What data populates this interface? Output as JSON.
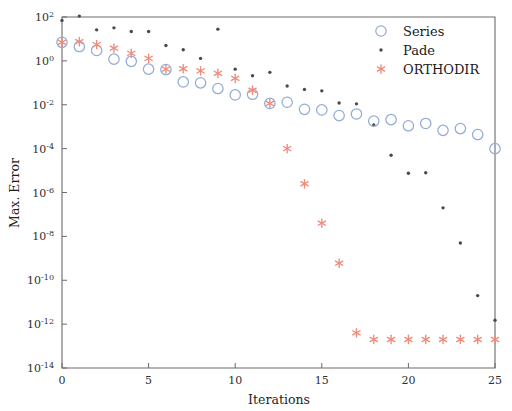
{
  "chart_data": {
    "type": "scatter",
    "title": "",
    "xlabel": "Iterations",
    "ylabel": "Max. Error",
    "xlim": [
      0,
      25
    ],
    "ylim": [
      1e-14,
      100.0
    ],
    "yscale": "log",
    "xscale": "linear",
    "grid": false,
    "legend_position": "top-right",
    "xticks": [
      0,
      5,
      10,
      15,
      20,
      25
    ],
    "xticklabels": [
      "0",
      "5",
      "10",
      "15",
      "20",
      "25"
    ],
    "yticks": [
      100,
      1,
      0.01,
      0.0001,
      1e-06,
      1e-08,
      1e-10,
      1e-12,
      1e-14
    ],
    "yticklabels": [
      "10^2",
      "10^0",
      "10^-2",
      "10^-4",
      "10^-6",
      "10^-8",
      "10^-10",
      "10^-12",
      "10^-14"
    ],
    "ytick_exponents": [
      "2",
      "0",
      "-2",
      "-4",
      "-6",
      "-8",
      "-10",
      "-12",
      "-14"
    ],
    "x": [
      0,
      1,
      2,
      3,
      4,
      5,
      6,
      7,
      8,
      9,
      10,
      11,
      12,
      13,
      14,
      15,
      16,
      17,
      18,
      19,
      20,
      21,
      22,
      23,
      24,
      25
    ],
    "series": [
      {
        "name": "Series",
        "marker": "circle-open",
        "color": "#93acd3",
        "values": [
          7.0,
          4.5,
          3.0,
          1.2,
          0.95,
          0.42,
          0.4,
          0.11,
          0.1,
          0.055,
          0.028,
          0.03,
          0.0115,
          0.013,
          0.0062,
          0.0058,
          0.0032,
          0.0038,
          0.0018,
          0.0021,
          0.0011,
          0.0014,
          0.00068,
          0.00082,
          0.00044,
          0.0001
        ]
      },
      {
        "name": "Pade",
        "marker": "dot",
        "color": "#4a4a4a",
        "values": [
          70.0,
          110.0,
          26.0,
          32.0,
          22.0,
          22.0,
          5.0,
          3.2,
          1.3,
          28.0,
          0.42,
          0.21,
          0.3,
          0.072,
          0.05,
          0.043,
          0.012,
          0.011,
          0.0012,
          5e-05,
          7.5e-06,
          8e-06,
          2e-07,
          5e-09,
          2e-11,
          1.5e-12
        ]
      },
      {
        "name": "ORTHODIR",
        "marker": "asterisk",
        "color": "#f08a7a",
        "values": [
          7.0,
          7.5,
          5.5,
          3.8,
          2.2,
          1.3,
          0.42,
          0.44,
          0.35,
          0.27,
          0.16,
          0.046,
          0.0115,
          0.0001,
          2.5e-06,
          4e-08,
          6e-10,
          4e-13,
          2e-13,
          2e-13,
          2e-13,
          2e-13,
          2e-13,
          2e-13,
          2e-13,
          2e-13
        ]
      }
    ]
  },
  "legend": {
    "entries": [
      {
        "label": "Series",
        "marker": "circle-open",
        "color": "#93acd3"
      },
      {
        "label": "Pade",
        "marker": "dot",
        "color": "#4a4a4a"
      },
      {
        "label": "ORTHODIR",
        "marker": "asterisk",
        "color": "#f08a7a"
      }
    ]
  },
  "axes": {
    "x_title": "Iterations",
    "y_title": "Max. Error"
  },
  "colors": {
    "series": "#93acd3",
    "pade": "#4a4a4a",
    "orthodir": "#f08a7a",
    "axis": "#6b6b6b",
    "background": "#ffffff"
  }
}
